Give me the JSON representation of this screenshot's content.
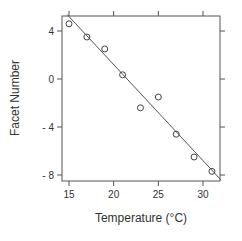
{
  "chart_data": {
    "type": "scatter",
    "title": "",
    "xlabel": "Temperature (°C)",
    "ylabel": "Facet Number",
    "xlim": [
      14.3,
      32.1
    ],
    "ylim": [
      -8.5,
      5.3
    ],
    "x_ticks": [
      15,
      20,
      25,
      30
    ],
    "y_ticks": [
      4,
      0,
      -4,
      -8
    ],
    "x_tick_labels": [
      "15",
      "20",
      "25",
      "30"
    ],
    "y_tick_labels": [
      "4",
      "0",
      "- 4",
      "- 8"
    ],
    "grid": false,
    "legend": null,
    "series": [
      {
        "name": "observations",
        "marker": "open-circle",
        "x": [
          15,
          17,
          19,
          21,
          23,
          25,
          27,
          29,
          31
        ],
        "y": [
          4.6,
          3.5,
          2.5,
          0.35,
          -2.4,
          -1.5,
          -4.6,
          -6.5,
          -7.7
        ]
      }
    ],
    "fit_line": {
      "name": "linear-fit",
      "intercept": 17.2,
      "slope": -0.8,
      "x_range": [
        14.8,
        32.0
      ]
    }
  },
  "colors": {
    "frame": "#555555",
    "points": "#444444",
    "line": "#555555",
    "text": "#333333"
  }
}
